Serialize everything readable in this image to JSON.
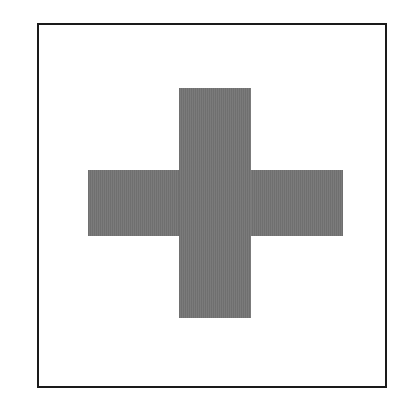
{
  "figure": {
    "shape": "plus-cross",
    "label": "Cross",
    "fill_color": "#767676",
    "frame_color": "#1a1a1a",
    "background_color": "#ffffff"
  }
}
